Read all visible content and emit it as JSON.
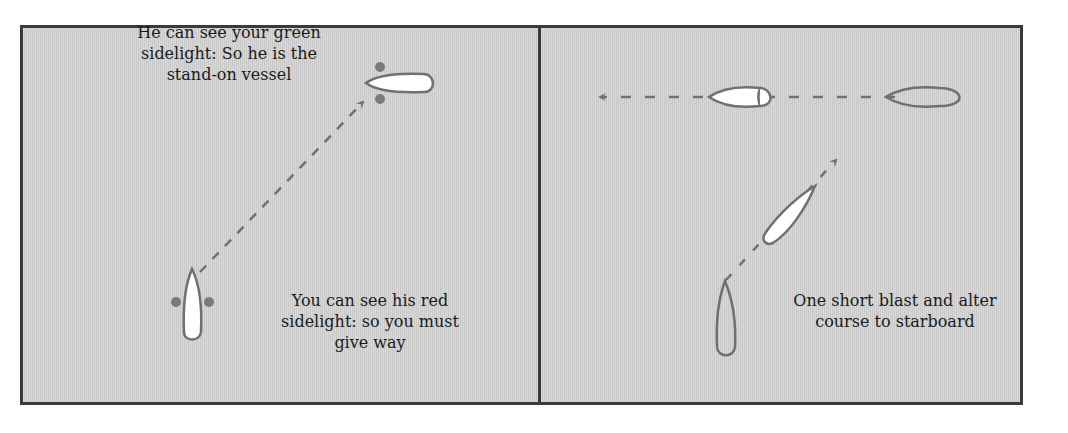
{
  "panels": [
    {
      "id": "left",
      "captions": {
        "stand_on": "He can see your green\nsidelight: So he is the\nstand-on vessel",
        "give_way": "You can see his red\nsidelight: so you must\ngive way"
      }
    },
    {
      "id": "right",
      "captions": {
        "action": "One short blast and alter\ncourse to starboard"
      }
    }
  ],
  "colors": {
    "background": "#cfcfcf",
    "border": "#3a3a3a",
    "hull_outline": "#707070",
    "hull_fill": "#ffffff",
    "sidelight": "#7a7a7a",
    "track": "#707070"
  }
}
